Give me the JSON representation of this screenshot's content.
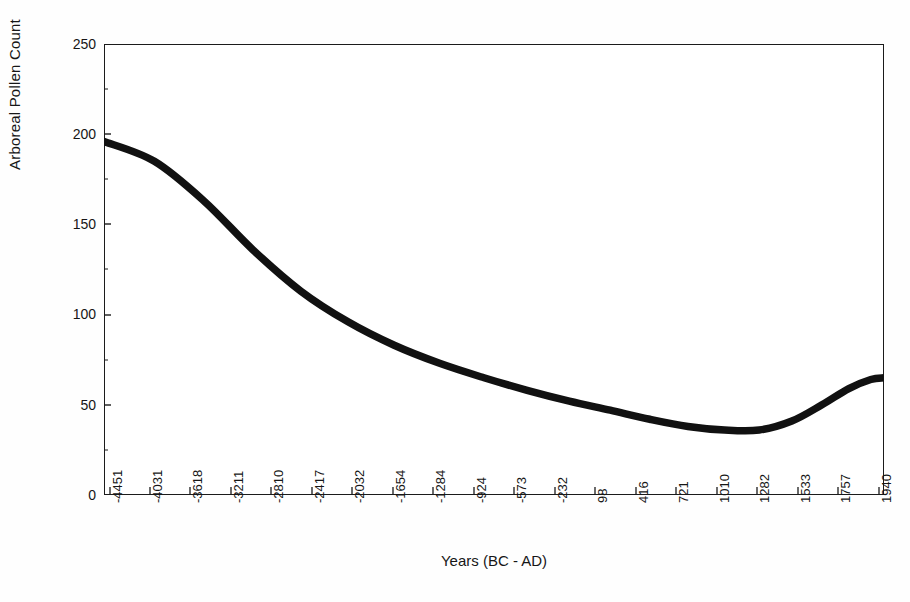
{
  "figure": {
    "background_color": "#ffffff",
    "line_color": "#111111",
    "axis_color": "#1b1b1b"
  },
  "axes": {
    "y_title": "Arboreal Pollen Count",
    "x_title": "Years (BC - AD)",
    "y_ticks": [
      "0",
      "50",
      "100",
      "150",
      "200",
      "250"
    ],
    "x_ticks": [
      "-4451",
      "-4031",
      "-3618",
      "-3211",
      "-2810",
      "-2417",
      "-2032",
      "-1654",
      "-1284",
      "-924",
      "-573",
      "-232",
      "98",
      "416",
      "721",
      "1010",
      "1282",
      "1533",
      "1757",
      "1940"
    ]
  },
  "caption_partial": "",
  "chart_data": {
    "type": "line",
    "title": "",
    "xlabel": "Years (BC - AD)",
    "ylabel": "Arboreal Pollen Count",
    "xlim": [
      -4451,
      2050
    ],
    "ylim": [
      0,
      250
    ],
    "grid": false,
    "legend": "none",
    "x_tick_labels": [
      "-4451",
      "-4031",
      "-3618",
      "-3211",
      "-2810",
      "-2417",
      "-2032",
      "-1654",
      "-1284",
      "-924",
      "-573",
      "-232",
      "98",
      "416",
      "721",
      "1010",
      "1282",
      "1533",
      "1757",
      "1940"
    ],
    "y_tick_values": [
      0,
      50,
      100,
      150,
      200,
      250
    ],
    "series": [
      {
        "name": "Arboreal Pollen Count",
        "x": [
          -4451,
          -4031,
          -3618,
          -3211,
          -2810,
          -2417,
          -2032,
          -1654,
          -1284,
          -924,
          -573,
          -232,
          98,
          416,
          721,
          1010,
          1282,
          1533,
          1757,
          1940,
          2050
        ],
        "values": [
          196,
          185,
          163,
          136,
          113,
          96,
          83,
          73,
          65,
          58,
          52,
          47,
          42,
          38,
          36,
          36,
          41,
          50,
          59,
          64,
          65
        ]
      }
    ],
    "notes": {
      "start_value": 196,
      "minimum_value": 35,
      "minimum_near_year": 800,
      "end_value": 65
    }
  }
}
